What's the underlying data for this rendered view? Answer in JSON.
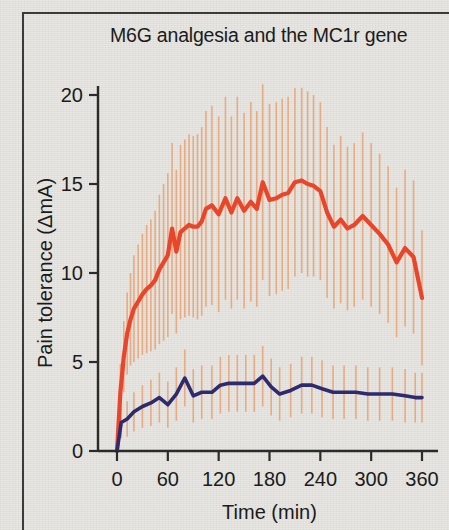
{
  "figure": {
    "background_color": "#e7e6e1",
    "frame_color": "#3b3b3b"
  },
  "chart_data": {
    "type": "line",
    "title": "M6G analgesia and the MC1r gene",
    "xlabel": "Time (min)",
    "ylabel": "Pain tolerance (ΔmA)",
    "xlim": [
      -10,
      370
    ],
    "ylim": [
      0,
      21.5
    ],
    "xticks": [
      0,
      60,
      120,
      180,
      240,
      300,
      360
    ],
    "xtick_labels": [
      "0",
      "60",
      "120",
      "180",
      "240",
      "300",
      "360"
    ],
    "yticks": [
      0,
      5,
      10,
      15,
      20
    ],
    "ytick_labels": [
      "0",
      "5",
      "10",
      "15",
      "20"
    ],
    "grid": false,
    "legend": "none",
    "errorbars": "vertical, one-sided/two-sided thin lines, light orange",
    "colors": {
      "series_high": "#e8452a",
      "series_low": "#2d2a6e",
      "errorbar": "#e8a97e",
      "axis": "#2b2b2b",
      "text": "#1b1b1b"
    },
    "series": [
      {
        "name": "high-response (MC1r variant) group",
        "color": "#e8452a",
        "x": [
          0,
          4,
          8,
          12,
          16,
          20,
          25,
          30,
          35,
          40,
          45,
          50,
          55,
          60,
          65,
          70,
          75,
          80,
          85,
          90,
          95,
          100,
          105,
          112,
          120,
          128,
          135,
          142,
          150,
          158,
          165,
          172,
          180,
          188,
          195,
          202,
          210,
          218,
          225,
          232,
          240,
          248,
          256,
          264,
          272,
          280,
          290,
          300,
          310,
          320,
          330,
          340,
          350,
          360
        ],
        "y": [
          0.0,
          3.3,
          5.3,
          6.6,
          7.4,
          8.0,
          8.4,
          8.8,
          9.1,
          9.3,
          9.6,
          10.2,
          10.6,
          11.0,
          12.5,
          11.2,
          12.3,
          12.5,
          12.7,
          12.6,
          12.6,
          12.9,
          13.6,
          13.8,
          13.3,
          14.2,
          13.4,
          14.2,
          13.5,
          14.0,
          13.6,
          15.1,
          14.1,
          14.2,
          14.4,
          14.5,
          15.1,
          15.2,
          15.0,
          14.9,
          14.6,
          13.4,
          12.6,
          13.0,
          12.5,
          12.7,
          13.2,
          12.7,
          12.2,
          11.6,
          10.6,
          11.4,
          10.9,
          8.6
        ],
        "yerr_hi": [
          0.0,
          1.6,
          2.0,
          2.3,
          2.6,
          3.0,
          3.2,
          3.4,
          3.6,
          3.7,
          3.9,
          4.2,
          4.4,
          4.6,
          4.8,
          4.6,
          4.9,
          5.0,
          5.1,
          5.1,
          5.2,
          5.3,
          5.5,
          5.6,
          5.5,
          5.7,
          5.4,
          5.7,
          5.5,
          5.6,
          5.5,
          5.5,
          5.4,
          5.4,
          5.4,
          5.4,
          5.3,
          5.2,
          5.2,
          5.1,
          5.0,
          4.8,
          4.6,
          4.7,
          4.6,
          4.6,
          4.7,
          4.6,
          4.5,
          4.4,
          4.2,
          4.4,
          4.3,
          3.8
        ],
        "yerr_lo": [
          0.0,
          1.6,
          2.0,
          2.3,
          2.6,
          3.0,
          3.2,
          3.4,
          3.6,
          3.7,
          3.9,
          4.2,
          4.4,
          4.6,
          4.8,
          4.6,
          4.9,
          5.0,
          5.1,
          5.1,
          5.2,
          5.3,
          5.5,
          5.6,
          5.5,
          5.7,
          5.4,
          5.7,
          5.5,
          5.6,
          5.5,
          5.5,
          5.4,
          5.4,
          5.4,
          5.4,
          5.3,
          5.2,
          5.2,
          5.1,
          5.0,
          4.8,
          4.6,
          4.7,
          4.6,
          4.6,
          4.7,
          4.6,
          4.5,
          4.4,
          4.2,
          4.4,
          4.3,
          3.8
        ]
      },
      {
        "name": "low-response (wild-type) group",
        "color": "#2d2a6e",
        "x": [
          0,
          5,
          12,
          20,
          30,
          40,
          50,
          60,
          70,
          80,
          90,
          100,
          112,
          122,
          132,
          142,
          152,
          162,
          172,
          182,
          192,
          205,
          218,
          230,
          242,
          255,
          268,
          282,
          296,
          310,
          325,
          340,
          352,
          360
        ],
        "y": [
          0.0,
          1.6,
          1.8,
          2.2,
          2.5,
          2.7,
          3.0,
          2.6,
          3.2,
          4.1,
          3.1,
          3.3,
          3.3,
          3.7,
          3.8,
          3.8,
          3.8,
          3.8,
          4.2,
          3.6,
          3.2,
          3.4,
          3.7,
          3.7,
          3.5,
          3.3,
          3.3,
          3.3,
          3.2,
          3.2,
          3.2,
          3.1,
          3.0,
          3.0
        ],
        "yerr_hi": [
          0.0,
          0.9,
          1.0,
          1.1,
          1.2,
          1.3,
          1.4,
          1.3,
          1.5,
          1.6,
          1.5,
          1.5,
          1.5,
          1.6,
          1.6,
          1.6,
          1.6,
          1.6,
          1.7,
          1.6,
          1.5,
          1.5,
          1.6,
          1.6,
          1.6,
          1.5,
          1.5,
          1.5,
          1.5,
          1.5,
          1.5,
          1.5,
          1.4,
          1.4
        ],
        "yerr_lo": [
          0.0,
          0.9,
          1.0,
          1.1,
          1.2,
          1.3,
          1.4,
          1.3,
          1.5,
          1.6,
          1.5,
          1.5,
          1.5,
          1.6,
          1.6,
          1.6,
          1.6,
          1.6,
          1.7,
          1.6,
          1.5,
          1.5,
          1.6,
          1.6,
          1.6,
          1.5,
          1.5,
          1.5,
          1.5,
          1.5,
          1.5,
          1.5,
          1.4,
          1.4
        ]
      }
    ]
  }
}
